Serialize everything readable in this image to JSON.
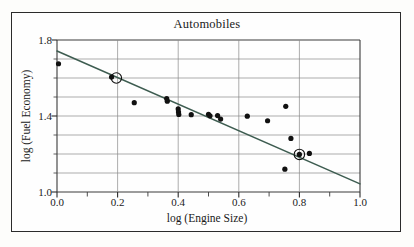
{
  "figure": {
    "title": "Automobiles",
    "has_outer_frame": true,
    "background_color": "#fefefe",
    "frame_color": "#2b2b2b"
  },
  "chart_data": {
    "type": "scatter",
    "title": "Automobiles",
    "xlabel": "log (Engine Size)",
    "ylabel": "log (Fuel Economy)",
    "xlim": [
      0.0,
      1.0
    ],
    "ylim": [
      1.0,
      1.8
    ],
    "x_tick_labels": [
      "0.0",
      "0.2",
      "0.4",
      "0.6",
      "0.8",
      "1.0"
    ],
    "x_ticks": [
      0.0,
      0.2,
      0.4,
      0.6,
      0.8,
      1.0
    ],
    "x_minor_ticks": [
      0.1,
      0.3,
      0.5,
      0.7,
      0.9
    ],
    "y_tick_labels": [
      "1.0",
      "1.4",
      "1.8"
    ],
    "y_ticks": [
      1.0,
      1.4,
      1.8
    ],
    "grid": {
      "vertical_at": [
        0.0,
        0.2,
        0.4,
        0.6,
        0.8,
        1.0
      ],
      "horizontal_at": [
        1.0,
        1.1,
        1.2,
        1.3,
        1.4,
        1.5,
        1.6,
        1.7,
        1.8
      ],
      "color": "#8a8a8a"
    },
    "legend": null,
    "marker_color": "#111111",
    "marker_size": 4.0,
    "points": [
      {
        "x": 0.005,
        "y": 1.675
      },
      {
        "x": 0.18,
        "y": 1.605
      },
      {
        "x": 0.255,
        "y": 1.47
      },
      {
        "x": 0.362,
        "y": 1.492
      },
      {
        "x": 0.364,
        "y": 1.478
      },
      {
        "x": 0.4,
        "y": 1.437
      },
      {
        "x": 0.401,
        "y": 1.421
      },
      {
        "x": 0.402,
        "y": 1.408
      },
      {
        "x": 0.443,
        "y": 1.407
      },
      {
        "x": 0.5,
        "y": 1.409
      },
      {
        "x": 0.505,
        "y": 1.401
      },
      {
        "x": 0.53,
        "y": 1.402
      },
      {
        "x": 0.54,
        "y": 1.384
      },
      {
        "x": 0.628,
        "y": 1.399
      },
      {
        "x": 0.695,
        "y": 1.375
      },
      {
        "x": 0.755,
        "y": 1.451
      },
      {
        "x": 0.772,
        "y": 1.282
      },
      {
        "x": 0.8,
        "y": 1.198
      },
      {
        "x": 0.833,
        "y": 1.203
      },
      {
        "x": 0.752,
        "y": 1.12
      }
    ],
    "highlighted_points": [
      {
        "x": 0.196,
        "y": 1.6,
        "style": "open-circle"
      },
      {
        "x": 0.8,
        "y": 1.198,
        "style": "open-circle"
      }
    ],
    "fit_line": {
      "type": "linear-regression",
      "color": "#3d5c50",
      "x_start": 0.0,
      "y_start": 1.742,
      "x_end": 1.0,
      "y_end": 1.043
    }
  },
  "axes": {
    "x_title": "log (Engine Size)",
    "y_title": "log (Fuel Economy)"
  }
}
